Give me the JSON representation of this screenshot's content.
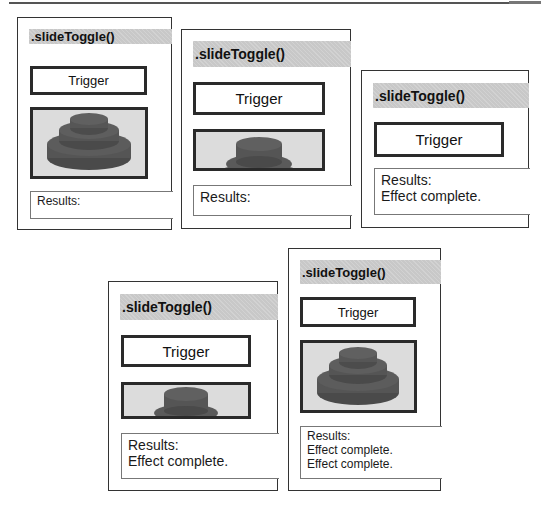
{
  "figure": {
    "panels": [
      {
        "id": 1,
        "title": ".slideToggle()",
        "trigger_label": "Trigger",
        "image_state": "fully-visible",
        "results": [
          "Results:"
        ]
      },
      {
        "id": 2,
        "title": ".slideToggle()",
        "trigger_label": "Trigger",
        "image_state": "partially-hidden",
        "results": [
          "Results:"
        ]
      },
      {
        "id": 3,
        "title": ".slideToggle()",
        "trigger_label": "Trigger",
        "image_state": "hidden",
        "results": [
          "Results:",
          "Effect complete."
        ]
      },
      {
        "id": 4,
        "title": ".slideToggle()",
        "trigger_label": "Trigger",
        "image_state": "partially-shown",
        "results": [
          "Results:",
          "Effect complete."
        ]
      },
      {
        "id": 5,
        "title": ".slideToggle()",
        "trigger_label": "Trigger",
        "image_state": "fully-visible",
        "results": [
          "Results:",
          "Effect complete.",
          "Effect complete."
        ]
      }
    ],
    "colors": {
      "header_band": "#c8c8c8",
      "border": "#333333",
      "image_background": "#dcdcdc",
      "object_fill": "#555555"
    }
  }
}
